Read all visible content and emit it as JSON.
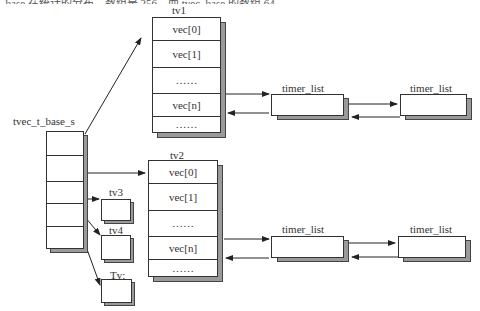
{
  "diagram": {
    "top_cropped_text": "_base 在统计的分布，数组是 256，而 tvec_base 的数组 64",
    "base": {
      "label": "tvec_t_base_s",
      "slots": 5
    },
    "tv1": {
      "label": "tv1",
      "cells": [
        "vec[0]",
        "vec[1]",
        "……",
        "vec[n]",
        "……"
      ]
    },
    "tv2": {
      "label": "tv2",
      "cells": [
        "vec[0]",
        "vec[1]",
        "……",
        "vec[n]",
        "……"
      ]
    },
    "tv3": {
      "label": "tv3"
    },
    "tv4": {
      "label": "tv4"
    },
    "tv5": {
      "label": "Tv:"
    },
    "timer_lists_row1": [
      {
        "label": "timer_list"
      },
      {
        "label": "timer_list"
      }
    ],
    "timer_lists_row2": [
      {
        "label": "timer_list"
      },
      {
        "label": "timer_list"
      }
    ],
    "colors": {
      "line": "#333333",
      "shadow": "#9a9a9a",
      "background": "#ffffff"
    }
  }
}
